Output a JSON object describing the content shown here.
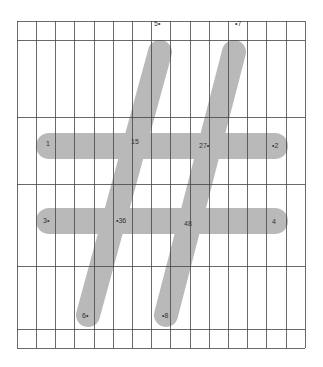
{
  "diagram": {
    "type": "stroke-order-glyph",
    "glyph": "#",
    "stroke_color": "#b9b9b9",
    "grid_color": "#444444",
    "background": "#ffffff",
    "grid": {
      "left": 17,
      "right": 305,
      "top": 21,
      "bottom": 348,
      "vertical_lines": [
        17,
        36,
        55,
        74,
        94,
        113,
        132,
        151,
        170,
        190,
        209,
        228,
        247,
        266,
        286,
        305
      ],
      "horizontal_lines": [
        21,
        40,
        117,
        184,
        266,
        329,
        348
      ]
    },
    "strokes": [
      {
        "name": "left-slant",
        "x1": 160,
        "y1": 52,
        "x2": 88,
        "y2": 315,
        "width": 24
      },
      {
        "name": "right-slant",
        "x1": 234,
        "y1": 52,
        "x2": 166,
        "y2": 315,
        "width": 24
      },
      {
        "name": "top-bar",
        "x1": 49,
        "y1": 146,
        "x2": 275,
        "y2": 146,
        "width": 26
      },
      {
        "name": "bottom-bar",
        "x1": 49,
        "y1": 221,
        "x2": 275,
        "y2": 221,
        "width": 26
      }
    ],
    "point_labels": [
      {
        "text": "5",
        "x": 154,
        "y": 20,
        "marker": "right"
      },
      {
        "text": "7",
        "x": 235,
        "y": 20,
        "marker": "left"
      },
      {
        "text": "1",
        "x": 46,
        "y": 140,
        "marker": "below"
      },
      {
        "text": "15",
        "x": 131,
        "y": 138,
        "marker": "below"
      },
      {
        "text": "27",
        "x": 199,
        "y": 142,
        "marker": "right"
      },
      {
        "text": "2",
        "x": 272,
        "y": 142,
        "marker": "left"
      },
      {
        "text": "3",
        "x": 43,
        "y": 217,
        "marker": "right"
      },
      {
        "text": "36",
        "x": 116,
        "y": 217,
        "marker": "left"
      },
      {
        "text": "48",
        "x": 184,
        "y": 220,
        "marker": "above"
      },
      {
        "text": "4",
        "x": 272,
        "y": 218,
        "marker": "above"
      },
      {
        "text": "6",
        "x": 82,
        "y": 312,
        "marker": "right"
      },
      {
        "text": "8",
        "x": 162,
        "y": 312,
        "marker": "left"
      }
    ]
  }
}
